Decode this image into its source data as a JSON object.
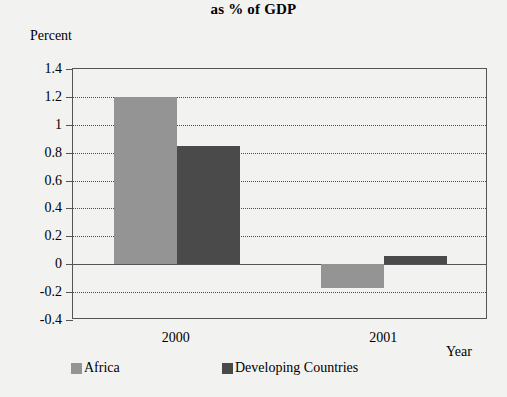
{
  "chart_data": {
    "type": "bar",
    "title": "as % of GDP",
    "xlabel": "Year",
    "ylabel": "Percent",
    "categories": [
      "2000",
      "2001"
    ],
    "series": [
      {
        "name": "Africa",
        "color": "#949494",
        "values": [
          1.2,
          -0.17
        ]
      },
      {
        "name": "Developing Countries",
        "color": "#4a4a4a",
        "values": [
          0.85,
          0.06
        ]
      }
    ],
    "ylim": [
      -0.4,
      1.4
    ],
    "ytick_labels": [
      "1.4",
      "1.2",
      "1",
      "0.8",
      "0.6",
      "0.4",
      "0.2",
      "0",
      "-0.2",
      "-0.4"
    ],
    "ytick_values": [
      1.4,
      1.2,
      1,
      0.8,
      0.6,
      0.4,
      0.2,
      0,
      -0.2,
      -0.4
    ],
    "grid": true,
    "legend_position": "bottom",
    "axis_color": "#555555",
    "background": "#f2f2f0"
  }
}
